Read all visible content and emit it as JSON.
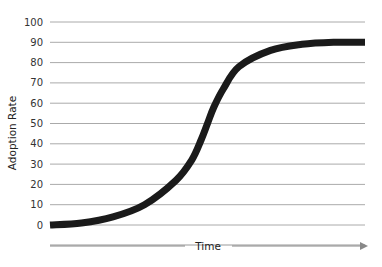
{
  "chart_data": {
    "type": "line",
    "title": "",
    "xlabel": "Time",
    "ylabel": "Adoption Rate",
    "ylim": [
      0,
      100
    ],
    "yticks": [
      0,
      10,
      20,
      30,
      40,
      50,
      60,
      70,
      80,
      90,
      100
    ],
    "grid": true,
    "legend": null,
    "x": [
      0,
      10,
      20,
      30,
      40,
      45,
      48,
      50,
      52,
      55,
      60,
      70,
      80,
      90,
      100
    ],
    "series": [
      {
        "name": "Adoption Rate",
        "values": [
          0,
          1,
          4,
          10,
          22,
          32,
          42,
          50,
          58,
          67,
          78,
          86,
          89,
          90,
          90
        ],
        "color": "#1a1a1a"
      }
    ]
  },
  "colors": {
    "curve": "#1a1a1a",
    "grid": "#aaaaaa",
    "axis_arrow": "#888888",
    "text": "#333333"
  }
}
